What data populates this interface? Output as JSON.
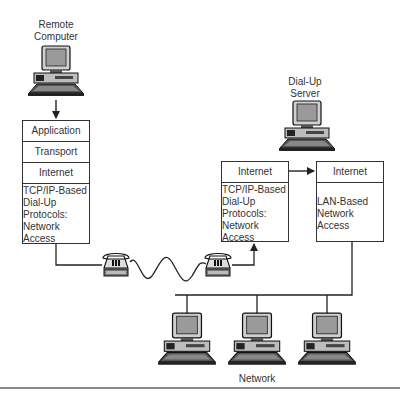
{
  "diagram": {
    "remote_computer": {
      "label_line1": "Remote",
      "label_line2": "Computer"
    },
    "dialup_server": {
      "label_line1": "Dial-Up",
      "label_line2": "Server"
    },
    "network": {
      "label": "Network"
    },
    "client_stack": {
      "layers": [
        {
          "name": "Application"
        },
        {
          "name": "Transport"
        },
        {
          "name": "Internet"
        },
        {
          "name_lines": [
            "TCP/IP-Based",
            "Dial-Up",
            "Protocols:",
            "Network",
            "Access"
          ]
        }
      ]
    },
    "server_dialup_stack": {
      "layers": [
        {
          "name": "Internet"
        },
        {
          "name_lines": [
            "TCP/IP-Based",
            "Dial-Up",
            "Protocols:",
            "Network",
            "Access"
          ]
        }
      ]
    },
    "server_lan_stack": {
      "layers": [
        {
          "name": "Internet"
        },
        {
          "name_lines": [
            "LAN-Based",
            "Network",
            "Access"
          ]
        }
      ]
    },
    "colors": {
      "line": "#222222",
      "box_border": "#333333",
      "background": "#ffffff",
      "rule": "#8a8a8a"
    }
  }
}
